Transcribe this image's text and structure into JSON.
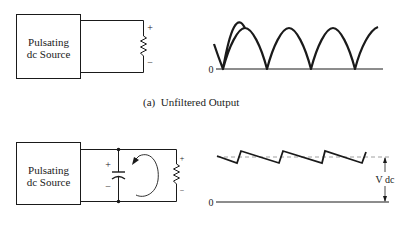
{
  "figure_a": {
    "source_box": {
      "line1": "Pulsating",
      "line2": "dc Source"
    },
    "resistor_polarity": {
      "plus": "+",
      "minus": "−"
    },
    "graph": {
      "zero_label": "0"
    },
    "caption": "(a)  Unfiltered Output"
  },
  "figure_b": {
    "source_box": {
      "line1": "Pulsating",
      "line2": "dc Source"
    },
    "capacitor_polarity": {
      "plus": "+",
      "minus": "−"
    },
    "resistor_polarity": {
      "plus": "+",
      "minus": "−"
    },
    "graph": {
      "zero_label": "0",
      "vdc_label": "V dc"
    }
  },
  "colors": {
    "ink": "#1a1a1a",
    "dashed": "#888888",
    "background": "#ffffff"
  }
}
